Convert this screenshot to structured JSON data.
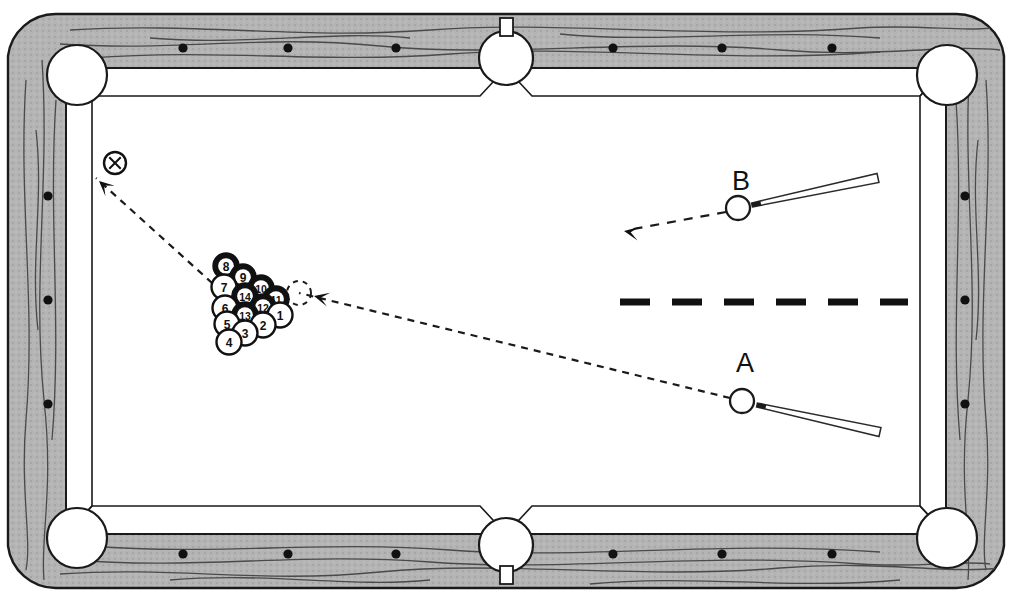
{
  "diagram": {
    "surface_color": "#ffffff",
    "rail_color": "#b0b0b0",
    "line_color": "#1a1a1a",
    "pocket_color": "#ffffff"
  },
  "table": {
    "outer": {
      "x": 8,
      "y": 14,
      "width": 996,
      "height": 574
    },
    "rail_inner": {
      "x": 66,
      "y": 68,
      "width": 880,
      "height": 466
    },
    "rail_dots_top": [
      183,
      288,
      396,
      613,
      722,
      832
    ],
    "rail_dots_bottom": [
      183,
      288,
      396,
      613,
      722,
      832
    ],
    "rail_dots_left": [
      196,
      300,
      404
    ],
    "rail_dots_right": [
      196,
      300,
      404
    ],
    "rail_dot_top_y": 48,
    "rail_dot_bottom_y": 554,
    "rail_dot_left_x": 48,
    "rail_dot_right_x": 965
  },
  "pockets": [
    {
      "name": "top-left-pocket",
      "cx": 77,
      "cy": 75,
      "r": 30
    },
    {
      "name": "top-side-pocket",
      "cx": 506,
      "cy": 58,
      "r": 27
    },
    {
      "name": "top-right-pocket",
      "cx": 947,
      "cy": 75,
      "r": 30
    },
    {
      "name": "bottom-left-pocket",
      "cx": 77,
      "cy": 538,
      "r": 30
    },
    {
      "name": "bottom-side-pocket",
      "cx": 506,
      "cy": 545,
      "r": 27
    },
    {
      "name": "bottom-right-pocket",
      "cx": 947,
      "cy": 538,
      "r": 30
    }
  ],
  "rack": {
    "ball_radius": 12.5,
    "label": "racked balls",
    "balls": [
      {
        "number": "8",
        "cx": 226,
        "cy": 266,
        "style": "solid"
      },
      {
        "number": "9",
        "cx": 243,
        "cy": 277,
        "style": "solid"
      },
      {
        "number": "7",
        "cx": 224,
        "cy": 287,
        "style": "open"
      },
      {
        "number": "10",
        "cx": 261,
        "cy": 288,
        "style": "solid"
      },
      {
        "number": "14",
        "cx": 245,
        "cy": 296,
        "style": "solid"
      },
      {
        "number": "11",
        "cx": 276,
        "cy": 299,
        "style": "solid"
      },
      {
        "number": "6",
        "cx": 225,
        "cy": 308,
        "style": "open"
      },
      {
        "number": "12",
        "cx": 263,
        "cy": 307,
        "style": "solid"
      },
      {
        "number": "13",
        "cx": 245,
        "cy": 315,
        "style": "solid"
      },
      {
        "number": "1",
        "cx": 280,
        "cy": 315,
        "style": "open"
      },
      {
        "number": "5",
        "cx": 227,
        "cy": 324,
        "style": "open"
      },
      {
        "number": "2",
        "cx": 263,
        "cy": 325,
        "style": "open"
      },
      {
        "number": "3",
        "cx": 245,
        "cy": 333,
        "style": "open"
      },
      {
        "number": "4",
        "cx": 229,
        "cy": 342,
        "style": "open"
      }
    ]
  },
  "ghost_ball": {
    "name": "ghost-contact-ball",
    "cx": 299,
    "cy": 293,
    "r": 12
  },
  "cue_balls": [
    {
      "id": "A",
      "label": "A",
      "cx": 742,
      "cy": 401,
      "r": 12,
      "label_x": 745,
      "label_y": 372,
      "cue_tip": {
        "x": 757,
        "y": 405
      },
      "cue_butt": {
        "x": 880,
        "y": 432
      }
    },
    {
      "id": "B",
      "label": "B",
      "cx": 738,
      "cy": 208,
      "r": 12,
      "label_x": 741,
      "label_y": 190,
      "cue_tip": {
        "x": 752,
        "y": 205
      },
      "cue_butt": {
        "x": 878,
        "y": 178
      }
    }
  ],
  "marker": {
    "name": "x-target-marker",
    "label": "X",
    "cx": 115,
    "cy": 163,
    "r": 11
  },
  "paths": [
    {
      "name": "path-a-to-rack",
      "from": "A",
      "points": "730,398 299,293",
      "dash": "7 6",
      "arrow_at": {
        "x": 314,
        "y": 296,
        "angle": 194
      }
    },
    {
      "name": "path-rack-to-x",
      "from": "rack",
      "points": "222,292 96,178",
      "dash": "7 6",
      "arrow_at": {
        "x": 99,
        "y": 181,
        "angle": 222
      }
    },
    {
      "name": "path-b-shot",
      "from": "B",
      "points": "726,212 628,230",
      "dash": "9 8",
      "arrow_at": {
        "x": 624,
        "y": 231,
        "angle": 190
      }
    }
  ],
  "head_string": {
    "name": "head-string-line",
    "y": 302,
    "x_start": 620,
    "x_end": 908,
    "dash": "30 22",
    "width": 7
  }
}
